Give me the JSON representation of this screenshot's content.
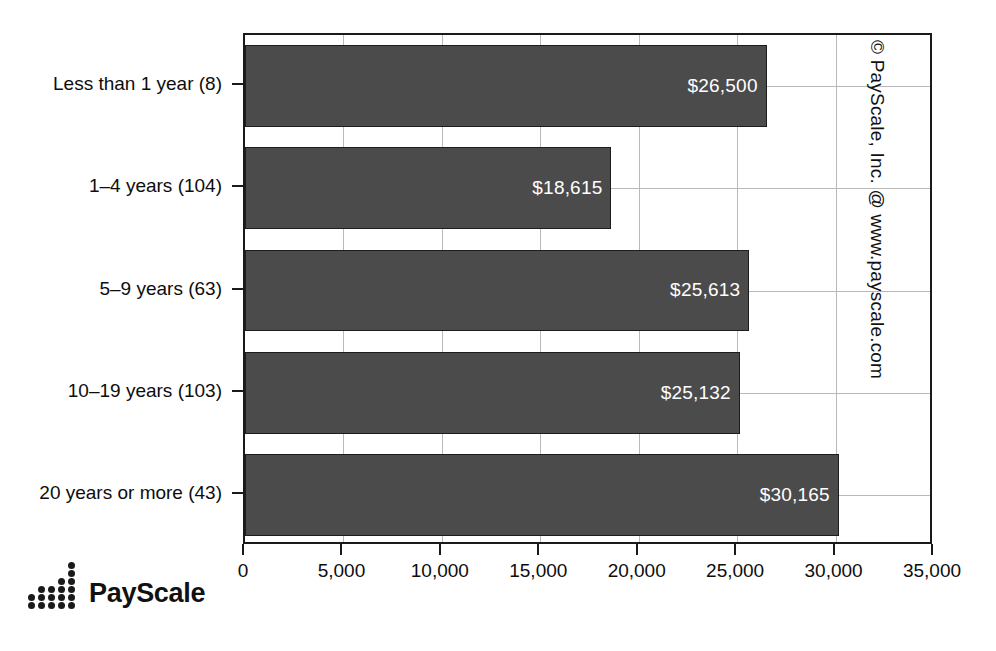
{
  "chart_data": {
    "type": "bar",
    "orientation": "horizontal",
    "title": "",
    "xlabel": "",
    "ylabel": "",
    "categories": [
      "Less than 1 year (8)",
      "1–4 years (104)",
      "5–9 years (63)",
      "10–19 years (103)",
      "20 years or more (43)"
    ],
    "values": [
      26500,
      18615,
      25613,
      25132,
      30165
    ],
    "value_labels": [
      "$26,500",
      "$18,615",
      "$25,613",
      "$25,132",
      "$30,165"
    ],
    "xlim": [
      0,
      35000
    ],
    "xticks": [
      0,
      5000,
      10000,
      15000,
      20000,
      25000,
      30000,
      35000
    ],
    "xtick_labels": [
      "0",
      "5,000",
      "10,000",
      "15,000",
      "20,000",
      "25,000",
      "30,000",
      "35,000"
    ],
    "grid": true,
    "legend": "none",
    "bar_color": "#4b4b4b",
    "label_color": "#ffffff",
    "axis_color": "#1a1a1a",
    "grid_color": "#b9b9b9"
  },
  "annotations": {
    "copyright": "© PayScale, Inc. @ www.payscale.com"
  },
  "logo": {
    "wordmark": "PayScale",
    "icon": "payscale-dots-logo"
  }
}
